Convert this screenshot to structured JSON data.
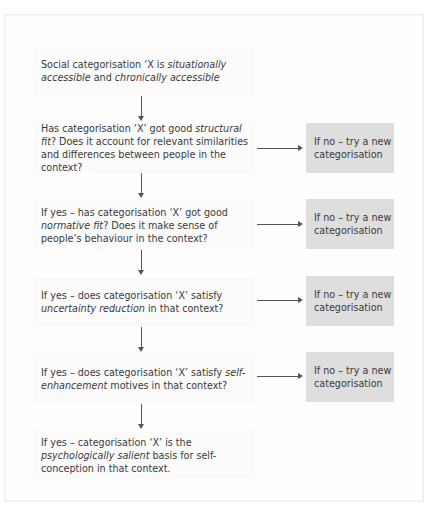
{
  "diagram": {
    "steps": [
      {
        "parts": [
          {
            "t": "Social categorisation ‘X is  "
          },
          {
            "t": "situationally",
            "i": true
          },
          {
            "t": " "
          },
          {
            "t": "accessible",
            "i": true
          },
          {
            "t": " and "
          },
          {
            "t": "chronically accessible",
            "i": true
          }
        ]
      },
      {
        "parts": [
          {
            "t": "Has categorisation ‘X’ got good "
          },
          {
            "t": "structural fit",
            "i": true
          },
          {
            "t": "? Does it account for relevant similarities and differences between people in the context?"
          }
        ]
      },
      {
        "parts": [
          {
            "t": "If yes – has categorisation ‘X’ got good "
          },
          {
            "t": "normative fit",
            "i": true
          },
          {
            "t": "? Does it make sense of people’s behaviour in the context?"
          }
        ]
      },
      {
        "parts": [
          {
            "t": "If yes – does categorisation ‘X’ satisfy "
          },
          {
            "t": "uncertainty reduction",
            "i": true
          },
          {
            "t": " in that context?"
          }
        ]
      },
      {
        "parts": [
          {
            "t": "If yes – does categorisation ‘X’ satisfy "
          },
          {
            "t": "self-enhancement",
            "i": true
          },
          {
            "t": " motives in that context?"
          }
        ]
      },
      {
        "parts": [
          {
            "t": "If yes – categorisation ‘X’ is the "
          },
          {
            "t": "psychologically salient",
            "i": true
          },
          {
            "t": " basis for self-conception in that context."
          }
        ]
      }
    ],
    "no_boxes": [
      {
        "label": "If no – try a new categorisation"
      },
      {
        "label": "If no – try a new categorisation"
      },
      {
        "label": "If no – try a new categorisation"
      },
      {
        "label": "If no – try a new categorisation"
      }
    ],
    "colors": {
      "no_box_fill": "#dedede",
      "step_fill": "#fbfbfb",
      "arrow": "#555555"
    }
  }
}
